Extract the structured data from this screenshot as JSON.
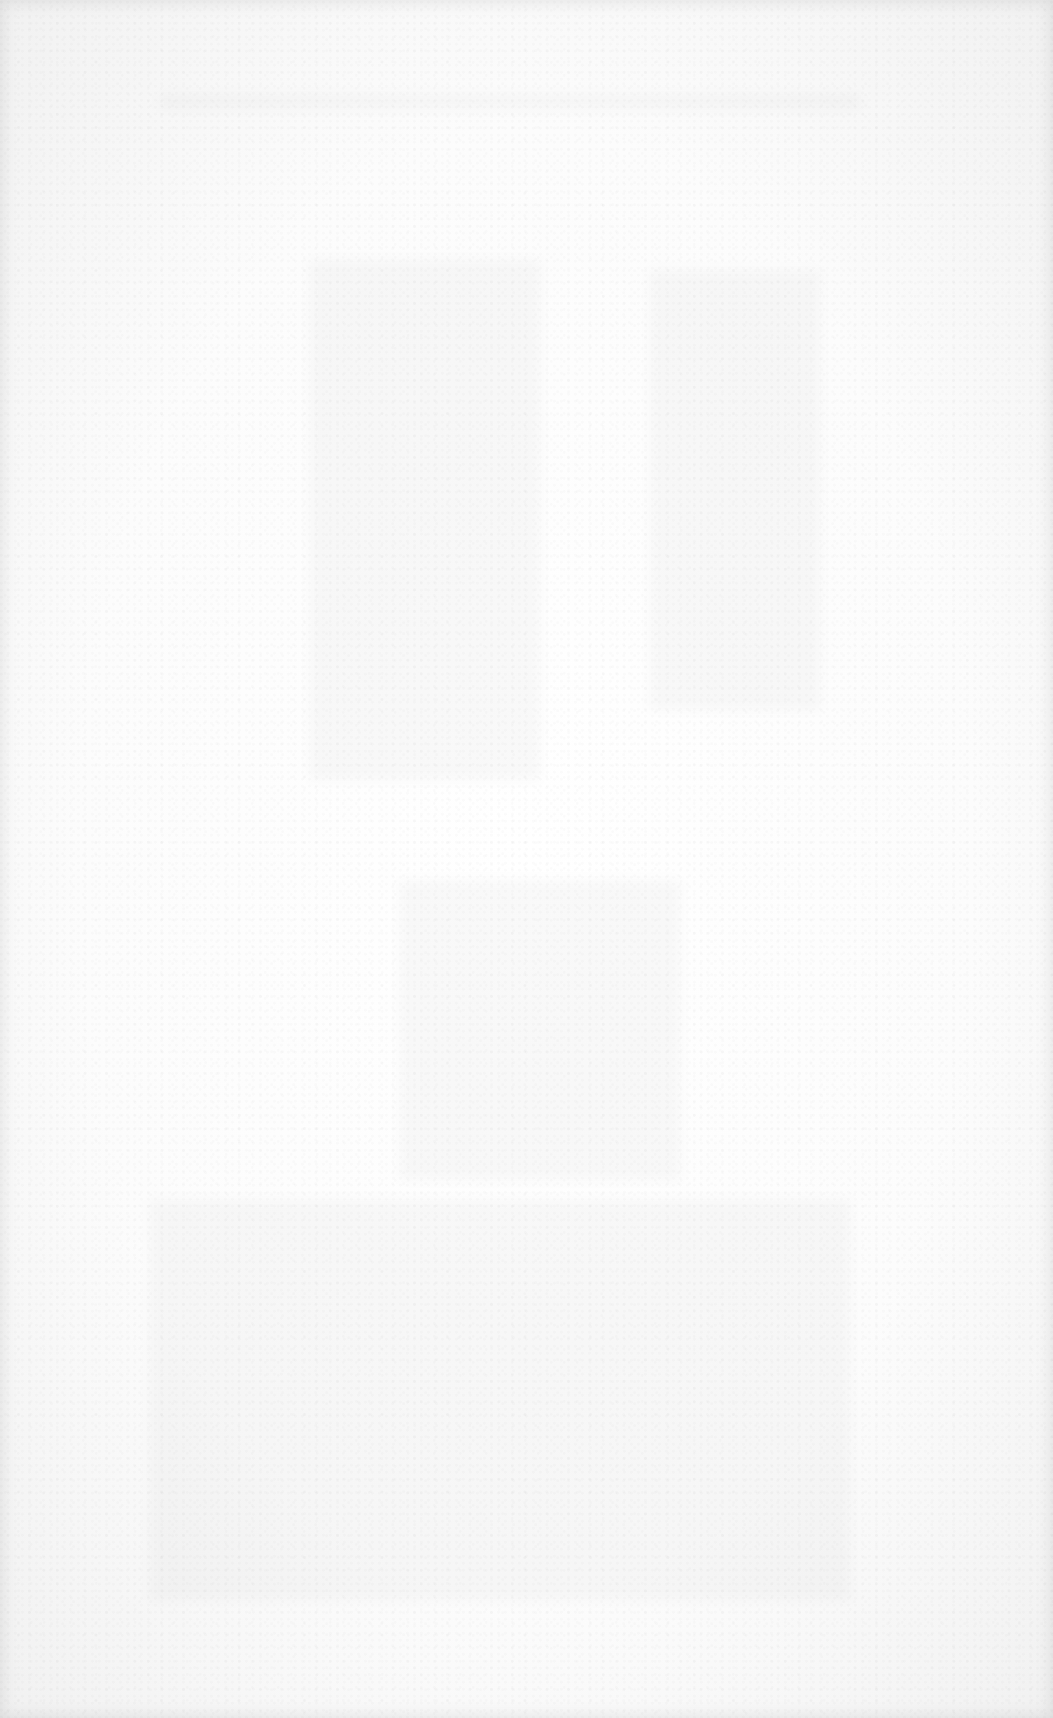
{
  "page": {
    "type": "scanned-blank-page",
    "text": "",
    "background_color": "#fdfdfd"
  }
}
